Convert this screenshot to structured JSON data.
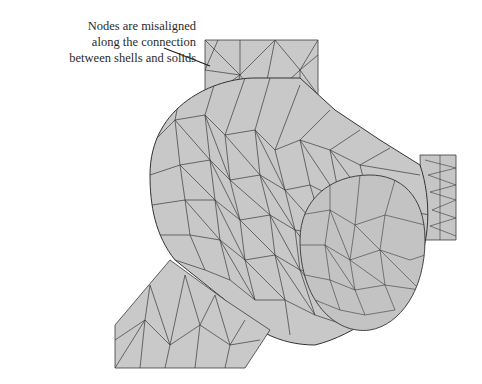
{
  "figure": {
    "annotation": {
      "lines": [
        "Nodes are misaligned",
        "along the connection",
        "between shells and solids"
      ]
    },
    "colors": {
      "background": "#ffffff",
      "mesh_fill": "#c8c8c8",
      "mesh_fill_dark": "#bdbdbd",
      "mesh_edge": "#3a3a3a",
      "annotation_text": "#2a2a2a",
      "leader_line": "#222222"
    },
    "parts": [
      {
        "name": "top-shell-plate",
        "type": "shell"
      },
      {
        "name": "cylinder-solid",
        "type": "solid"
      },
      {
        "name": "inner-bore",
        "type": "solid"
      },
      {
        "name": "right-shell-stub",
        "type": "shell"
      },
      {
        "name": "bottom-shell-plate",
        "type": "shell"
      }
    ]
  }
}
